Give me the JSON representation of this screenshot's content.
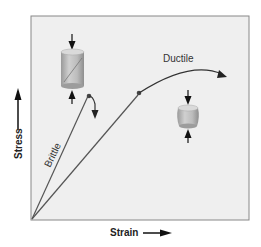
{
  "diagram": {
    "axes": {
      "x_label": "Strain",
      "y_label": "Stress"
    },
    "curves": [
      {
        "name": "brittle",
        "label": "Brittle",
        "behavior": "linear rise then sudden fracture"
      },
      {
        "name": "ductile",
        "label": "Ductile",
        "behavior": "linear rise, yield point, then plastic flow"
      }
    ],
    "specimens": [
      {
        "name": "brittle-specimen",
        "description": "tall cylinder with diagonal fracture under compression"
      },
      {
        "name": "ductile-specimen",
        "description": "short barrel-shaped cylinder under compression"
      }
    ],
    "colors": {
      "frame_border": "#888888",
      "plot_background": "#efefef",
      "curve_line": "#555555",
      "ductile_curve": "#333333",
      "specimen_fill": "#b8b8b8",
      "arrow": "#111111"
    }
  }
}
